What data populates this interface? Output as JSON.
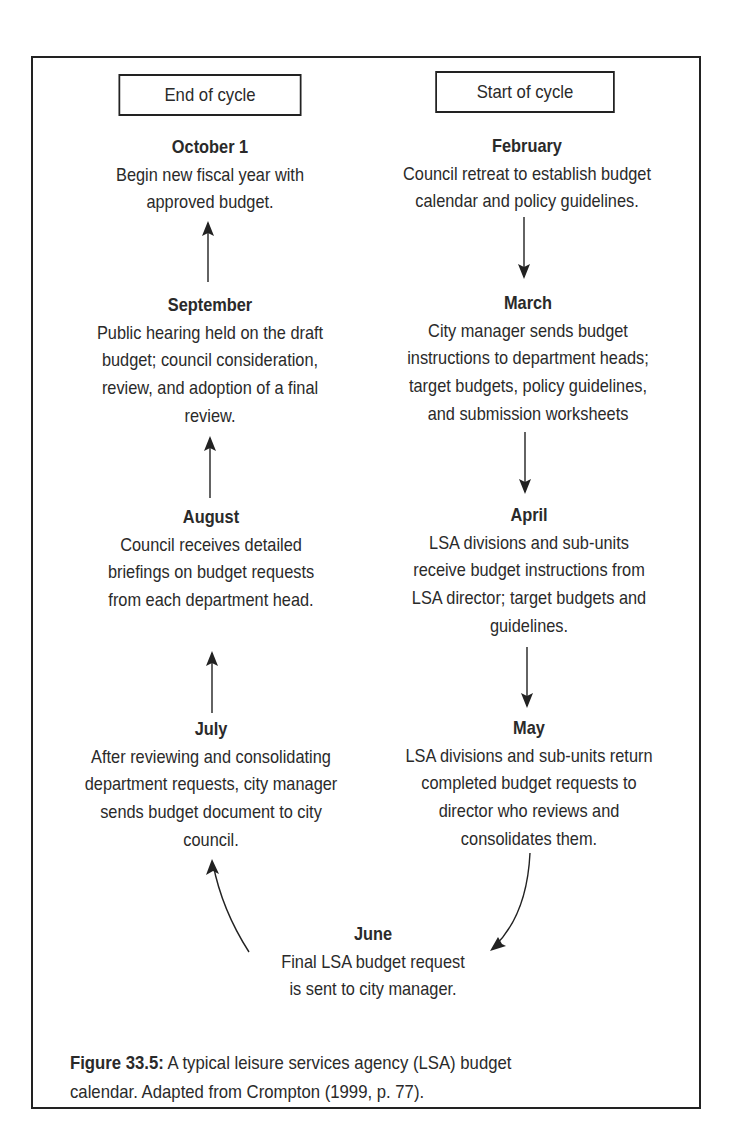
{
  "headers": {
    "end": "End of cycle",
    "start": "Start of cycle"
  },
  "steps": [
    {
      "month": "October 1",
      "lines": [
        "Begin new fiscal year with",
        "approved budget."
      ]
    },
    {
      "month": "September",
      "lines": [
        "Public hearing held on the draft",
        "budget; council consideration,",
        "review, and adoption of a final",
        "review."
      ]
    },
    {
      "month": "August",
      "lines": [
        "Council receives detailed",
        "briefings on budget requests",
        "from each department head."
      ]
    },
    {
      "month": "July",
      "lines": [
        "After reviewing and consolidating",
        "department requests, city manager",
        "sends budget document to city",
        "council."
      ]
    },
    {
      "month": "February",
      "lines": [
        "Council retreat to establish budget",
        "calendar and policy guidelines."
      ]
    },
    {
      "month": "March",
      "lines": [
        "City manager sends budget",
        "instructions to department heads;",
        "target budgets, policy guidelines,",
        "and submission worksheets"
      ]
    },
    {
      "month": "April",
      "lines": [
        "LSA divisions and sub-units",
        "receive budget instructions from",
        "LSA director; target budgets and",
        "guidelines."
      ]
    },
    {
      "month": "May",
      "lines": [
        "LSA divisions and sub-units return",
        "completed budget requests to",
        "director who reviews and",
        "consolidates them."
      ]
    },
    {
      "month": "June",
      "lines": [
        "Final LSA budget request",
        "is sent to city manager."
      ]
    }
  ],
  "caption": {
    "label": "Figure 33.5:",
    "line1": " A typical leisure services agency (LSA) budget",
    "line2": "calendar. Adapted from Crompton (1999, p. 77)."
  },
  "colors": {
    "ink": "#222222",
    "background": "#ffffff"
  }
}
